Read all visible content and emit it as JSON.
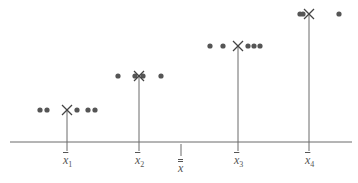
{
  "diagram": {
    "title": "",
    "colors": {
      "line": "#6a6a6a",
      "point": "#555555",
      "mean_marker": "#444444",
      "background": "#ffffff"
    },
    "axis_y": 142,
    "groups": [
      {
        "label_base": "x",
        "label_sub": "1",
        "mean_x": 67,
        "level_y": 110,
        "points_x": [
          40,
          47,
          77,
          88,
          95
        ]
      },
      {
        "label_base": "x",
        "label_sub": "2",
        "mean_x": 139,
        "level_y": 76,
        "points_x": [
          118,
          135,
          143,
          161
        ]
      },
      {
        "label_base": "x",
        "label_sub": "3",
        "mean_x": 238,
        "level_y": 46,
        "points_x": [
          210,
          223,
          248,
          254,
          260
        ]
      },
      {
        "label_base": "x",
        "label_sub": "4",
        "mean_x": 309,
        "level_y": 14,
        "points_x": [
          300,
          303,
          339
        ]
      }
    ],
    "grand_mean": {
      "label": "x",
      "x": 181
    }
  }
}
